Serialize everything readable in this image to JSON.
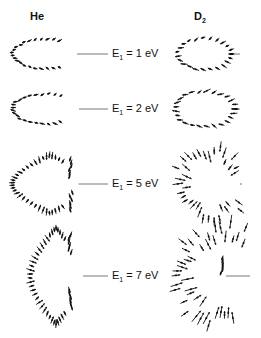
{
  "figure": {
    "columns": [
      {
        "id": "he",
        "label": "He",
        "x": 30,
        "y": 10
      },
      {
        "id": "d2",
        "label_main": "D",
        "label_sub": "2",
        "x": 194,
        "y": 10
      }
    ],
    "rows": [
      {
        "energy_label": "E",
        "energy_sub": "1",
        "energy_value": " = 1 eV",
        "y": 54,
        "he": {
          "shape": "ellipse",
          "cx": 45,
          "cy": 54,
          "rx": 32,
          "ry": 15,
          "open_right": 0.35,
          "n": 22,
          "len": 5
        },
        "d2": {
          "shape": "ellipse",
          "cx": 205,
          "cy": 54,
          "rx": 27,
          "ry": 16,
          "open_right": 0.0,
          "n": 24,
          "len": 6
        }
      },
      {
        "energy_label": "E",
        "energy_sub": "1",
        "energy_value": " = 2 eV",
        "y": 109,
        "he": {
          "shape": "ellipse",
          "cx": 46,
          "cy": 109,
          "rx": 33,
          "ry": 15,
          "open_right": 0.35,
          "n": 22,
          "len": 5
        },
        "d2": {
          "shape": "ellipse",
          "cx": 205,
          "cy": 109,
          "rx": 30,
          "ry": 18,
          "open_right": 0.0,
          "n": 26,
          "len": 7
        }
      },
      {
        "energy_label": "E",
        "energy_sub": "1",
        "energy_value": " = 5 eV",
        "y": 184,
        "he": {
          "shape": "butterfly",
          "cx": 50,
          "cy": 184,
          "rx": 38,
          "ry": 28,
          "n": 34,
          "len": 7
        },
        "d2": {
          "shape": "ellipse",
          "cx": 212,
          "cy": 184,
          "rx": 36,
          "ry": 34,
          "open_right": 0.18,
          "n": 36,
          "len": 10
        }
      },
      {
        "energy_label": "E",
        "energy_sub": "1",
        "energy_value": " = 7 eV",
        "y": 276,
        "he": {
          "shape": "butterfly7",
          "cx": 62,
          "cy": 276,
          "rx": 28,
          "ry": 48,
          "n": 36,
          "len": 8
        },
        "d2": {
          "shape": "fan",
          "cx": 226,
          "cy": 276,
          "rx": 50,
          "ry": 48,
          "n": 40,
          "len": 12
        }
      }
    ],
    "line_color": "#555555",
    "arrow_color": "#111111",
    "label_x": 112
  }
}
